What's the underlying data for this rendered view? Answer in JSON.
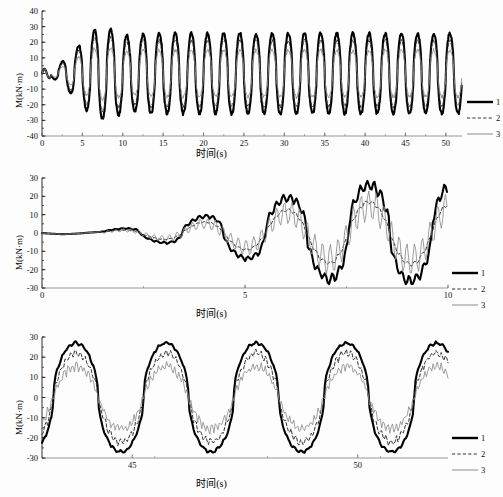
{
  "figure": {
    "background_color": "#fdfdfd",
    "axis_color": "#1a1a1a",
    "series_colors": {
      "curve1": "#000000",
      "curve2": "#333333",
      "curve3": "#8c8c8c"
    }
  },
  "legend": {
    "entries": [
      {
        "label": "1",
        "style": "thick-solid"
      },
      {
        "label": "2",
        "style": "dashed"
      },
      {
        "label": "3",
        "style": "thin-solid"
      }
    ]
  },
  "labels": {
    "xlabel": "时间(s)",
    "ylabel": "M(kN·m)"
  },
  "chart_data": [
    {
      "type": "line",
      "panel": "top",
      "title": "",
      "xlabel": "时间(s)",
      "ylabel": "M(kN·m)",
      "xlim": [
        0,
        52
      ],
      "ylim": [
        -40,
        40
      ],
      "xticks": [
        0,
        5,
        10,
        15,
        20,
        25,
        30,
        35,
        40,
        45,
        50
      ],
      "yticks": [
        -40,
        -30,
        -20,
        -10,
        0,
        10,
        20,
        30,
        40
      ],
      "grid": false,
      "legend_position": "right",
      "series": [
        {
          "name": "1",
          "style": "thick-solid",
          "x": [
            0,
            0.4,
            0.8,
            1.2,
            1.6,
            2,
            2.4,
            2.8,
            3.2,
            3.6,
            4,
            4.4,
            4.8,
            5.2,
            5.6,
            6,
            6.4,
            6.8,
            7.2,
            7.6,
            8,
            8.4,
            8.8,
            9.2,
            9.6,
            10,
            10.4,
            10.8,
            11.2,
            11.6,
            12,
            12.4,
            12.8,
            13.2,
            13.6,
            14,
            14.4,
            14.8,
            15.2,
            15.6,
            16,
            16.4,
            16.8,
            17.2,
            17.6,
            18,
            18.4,
            18.8,
            19.2,
            19.6,
            20,
            20.4,
            20.8,
            21.2,
            21.6,
            22,
            22.4,
            22.8,
            23.2,
            23.6,
            24,
            24.4,
            24.8,
            25.2,
            25.6,
            26,
            26.4,
            26.8,
            27.2,
            27.6,
            28,
            28.4,
            28.8,
            29.2,
            29.6,
            30,
            30.4,
            30.8,
            31.2,
            31.6,
            32,
            32.4,
            32.8,
            33.2,
            33.6,
            34,
            34.4,
            34.8,
            35.2,
            35.6,
            36,
            36.4,
            36.8,
            37.2,
            37.6,
            38,
            38.4,
            38.8,
            39.2,
            39.6,
            40,
            40.4,
            40.8,
            41.2,
            41.6,
            42,
            42.4,
            42.8,
            43.2,
            43.6,
            44,
            44.4,
            44.8,
            45.2,
            45.6,
            46,
            46.4,
            46.8,
            47.2,
            47.6,
            48,
            48.4,
            48.8,
            49.2,
            49.6,
            50,
            50.4,
            50.8,
            51.2,
            51.6,
            52
          ],
          "values": [
            0,
            -2,
            2,
            8,
            4,
            -3,
            -9,
            -4,
            5,
            10,
            12,
            3,
            -12,
            -22,
            -10,
            14,
            27,
            5,
            -20,
            -26,
            -4,
            22,
            29,
            2,
            -26,
            -29,
            0,
            27,
            32,
            -2,
            -28,
            -28,
            4,
            26,
            24,
            -5,
            -26,
            -27,
            3,
            27,
            28,
            -4,
            -28,
            -26,
            5,
            25,
            26,
            -6,
            -27,
            -28,
            4,
            28,
            31,
            -3,
            -28,
            -30,
            3,
            25,
            26,
            -5,
            -26,
            -27,
            4,
            26,
            27,
            -5,
            -27,
            -26,
            5,
            26,
            27,
            -4,
            -26,
            -27,
            5,
            27,
            26,
            -5,
            -26,
            -27,
            4,
            26,
            26,
            -5,
            -27,
            -26,
            5,
            25,
            26,
            -5,
            -26,
            -26,
            5,
            26,
            25,
            -5,
            -25,
            -26,
            5,
            26,
            25,
            -5,
            -26,
            -25,
            5,
            25,
            26,
            -5,
            -25,
            -25,
            5,
            25,
            25,
            -5,
            -25,
            -25,
            5,
            25,
            24,
            -5,
            -24,
            -25,
            4,
            24,
            24,
            -5,
            -25,
            -24,
            4,
            24,
            -28
          ]
        },
        {
          "name": "2",
          "style": "dashed",
          "note": "slightly lower amplitude than curve 1, follows same phase"
        },
        {
          "name": "3",
          "style": "thin-solid",
          "note": "smallest amplitude, roughly 55-60% of curve 1"
        }
      ]
    },
    {
      "type": "line",
      "panel": "middle",
      "title": "",
      "xlabel": "时间(s)",
      "ylabel": "M(kN·m)",
      "xlim": [
        0,
        10
      ],
      "ylim": [
        -30,
        30
      ],
      "xticks": [
        0,
        5,
        10
      ],
      "yticks": [
        -30,
        -20,
        -10,
        0,
        10,
        20,
        30
      ],
      "grid": false,
      "legend_position": "right",
      "series": [
        {
          "name": "1",
          "style": "thick-solid",
          "x": [
            0,
            0.2,
            0.4,
            0.6,
            0.8,
            1,
            1.2,
            1.4,
            1.6,
            1.8,
            2,
            2.2,
            2.4,
            2.6,
            2.8,
            3,
            3.2,
            3.4,
            3.6,
            3.8,
            4,
            4.2,
            4.4,
            4.6,
            4.8,
            5,
            5.2,
            5.4,
            5.6,
            5.8,
            6,
            6.2,
            6.4,
            6.6,
            6.8,
            7,
            7.2,
            7.4,
            7.6,
            7.8,
            8,
            8.2,
            8.4,
            8.6,
            8.8,
            9,
            9.2,
            9.4,
            9.6,
            9.8,
            10
          ],
          "values": [
            0,
            0,
            -1,
            -2,
            -2,
            -1,
            1,
            4,
            7,
            8,
            5,
            0,
            -3,
            -4,
            -2,
            0,
            0,
            -2,
            -6,
            -8,
            -5,
            -2,
            -4,
            -7,
            -9,
            -5,
            0,
            3,
            6,
            4,
            2,
            5,
            8,
            6,
            2,
            -2,
            -6,
            -10,
            -8,
            -5,
            -9,
            -14,
            -22,
            -12,
            -4,
            2,
            8,
            14,
            20,
            24,
            18,
            12,
            16,
            20,
            12,
            4,
            -4,
            -10,
            -16,
            -22,
            -26,
            -18,
            -10,
            -4,
            2,
            8,
            14,
            18,
            23,
            16,
            8,
            2,
            -6,
            -12,
            -18,
            -24,
            -28,
            -20,
            -12,
            -6,
            2,
            8,
            14
          ]
        },
        {
          "name": "2",
          "style": "dashed",
          "note": "smoother, lower amplitude version of curve 1"
        },
        {
          "name": "3",
          "style": "thin-solid",
          "note": "higher-frequency ripple overlaid, lowest peaks"
        }
      ]
    },
    {
      "type": "line",
      "panel": "bottom",
      "title": "",
      "xlabel": "时间(s)",
      "ylabel": "M(kN·m)",
      "xlim": [
        43,
        52
      ],
      "ylim": [
        -30,
        30
      ],
      "xticks": [
        45,
        50
      ],
      "yticks": [
        -30,
        -20,
        -10,
        0,
        10,
        20,
        30
      ],
      "grid": false,
      "legend_position": "right",
      "series": [
        {
          "name": "1",
          "style": "thick-solid",
          "peak_value": 27,
          "trough_value": -28,
          "period": 2.0,
          "note": "largest amplitude square-ish sinusoid"
        },
        {
          "name": "2",
          "style": "dashed",
          "peak_value": 22,
          "trough_value": -22,
          "period": 2.0,
          "note": "intermediate amplitude with jagged peaks"
        },
        {
          "name": "3",
          "style": "thin-solid",
          "peak_value": 15,
          "trough_value": -16,
          "period": 2.0,
          "note": "smallest amplitude, noisy peaks"
        }
      ]
    }
  ]
}
